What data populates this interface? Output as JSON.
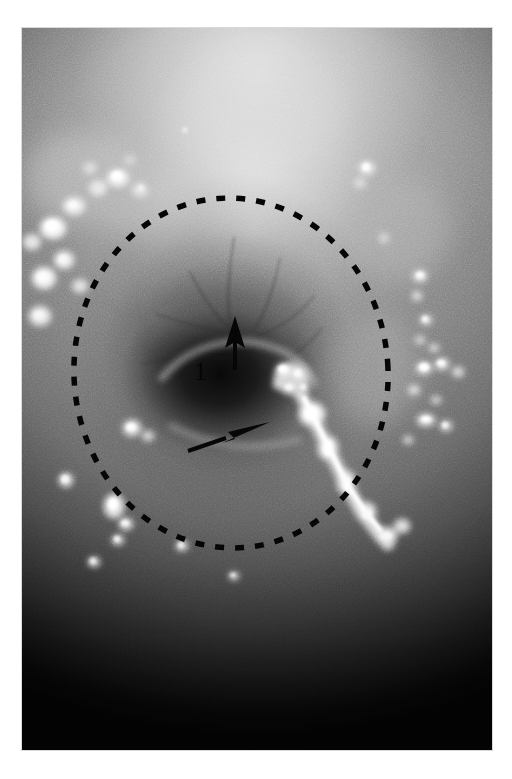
{
  "figure": {
    "kind": "endoscopic-photograph",
    "modality": "white-light endoscopy",
    "orientation": "portrait",
    "caption": "",
    "background_color": "#ffffff",
    "plate": {
      "left": 22,
      "top": 28,
      "width": 470,
      "height": 722,
      "border_color": "#d9d9d9",
      "fill_color": "#111111"
    }
  },
  "image_content": {
    "description": "Grayscale endoscopic photograph of a mucosal surface with a central dark depressed lesion, scattered bright specular reflections and a dark lower field.",
    "tonal_regions": [
      {
        "name": "upper-mucosa-bright-band",
        "tone": "#c8c8c8",
        "position": "top-center"
      },
      {
        "name": "mid-mucosa",
        "tone": "#8b8b8b",
        "position": "middle"
      },
      {
        "name": "central-crater",
        "tone": "#0a0a0a",
        "position": "center"
      },
      {
        "name": "lower-field-dark",
        "tone": "#000000",
        "position": "bottom"
      }
    ],
    "specular_highlights_count": 38,
    "bright_streak": {
      "name": "mucus-streak",
      "from_x": 300,
      "from_y": 398,
      "to_x": 392,
      "to_y": 500
    }
  },
  "annotations": {
    "region_outline": {
      "name": "dashed-ellipse",
      "shape": "ellipse",
      "style": "dashed",
      "color": "#060606",
      "stroke_width": 5.5,
      "dash_pattern": "9 11",
      "center_x": 209,
      "center_y": 345,
      "radius_x": 157,
      "radius_y": 175,
      "rotation_deg": -4
    },
    "markers": [
      {
        "name": "arrow-up",
        "type": "arrow",
        "direction": "up",
        "color": "#060606",
        "tip_x": 213,
        "tip_y": 290,
        "tail_x": 213,
        "tail_y": 342
      },
      {
        "name": "arrow-diagonal",
        "type": "arrow",
        "direction": "up-right",
        "color": "#060606",
        "tip_x": 244,
        "tip_y": 396,
        "tail_x": 163,
        "tail_y": 424
      }
    ],
    "labels": [
      {
        "name": "label-1",
        "text": "1",
        "color": "#060606",
        "x": 176,
        "y": 348
      }
    ]
  }
}
